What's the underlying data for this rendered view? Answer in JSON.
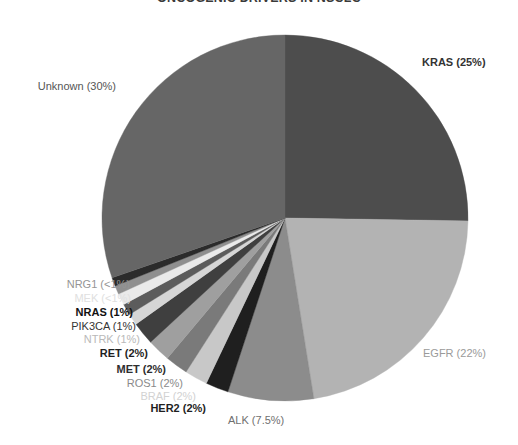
{
  "chart_data": {
    "type": "pie",
    "title": "ONCOGENIC DRIVERS IN NSCLC",
    "xlabel": "",
    "ylabel": "",
    "legend_position": "none",
    "grid": false,
    "categories": [
      "KRAS",
      "EGFR",
      "ALK",
      "HER2",
      "BRAF",
      "ROS1",
      "MET",
      "RET",
      "NTRK",
      "PIK3CA",
      "NRAS",
      "MEK",
      "NRG1",
      "Unknown"
    ],
    "values": [
      25,
      22,
      7.5,
      2,
      2,
      2,
      2,
      2,
      1,
      1,
      1,
      0.75,
      0.75,
      30
    ],
    "value_labels": [
      "25%",
      "22%",
      "7.5%",
      "2%",
      "2%",
      "2%",
      "2%",
      "2%",
      "1%",
      "1%",
      "1%",
      "<1%",
      "<1%",
      "30%"
    ],
    "slice_colors": [
      "#4d4d4d",
      "#b3b3b3",
      "#8c8c8c",
      "#1f1f1f",
      "#c8c8c8",
      "#7a7a7a",
      "#9f9f9f",
      "#3f3f3f",
      "#d6d6d6",
      "#5c5c5c",
      "#eaeaea",
      "#8f8f8f",
      "#2b2b2b",
      "#666666"
    ],
    "start_angle_deg": -90,
    "direction": "clockwise"
  },
  "labels": [
    {
      "id": "kras",
      "text": "KRAS (25%)",
      "color": "#333333",
      "bold": true,
      "x": 422,
      "y": 57,
      "align": "left"
    },
    {
      "id": "egfr",
      "text": "EGFR (22%)",
      "color": "#9a9a9a",
      "bold": false,
      "x": 423,
      "y": 348,
      "align": "left"
    },
    {
      "id": "alk",
      "text": "ALK (7.5%)",
      "color": "#6f6f6f",
      "bold": false,
      "x": 228,
      "y": 415,
      "align": "left"
    },
    {
      "id": "her2",
      "text": "HER2 (2%)",
      "color": "#1f1f1f",
      "bold": true,
      "x": 206,
      "y": 403,
      "align": "right"
    },
    {
      "id": "braf",
      "text": "BRAF (2%)",
      "color": "#d2d2d2",
      "bold": false,
      "x": 196,
      "y": 391,
      "align": "right"
    },
    {
      "id": "ros1",
      "text": "ROS1 (2%)",
      "color": "#8a8a8a",
      "bold": false,
      "x": 183,
      "y": 378,
      "align": "right"
    },
    {
      "id": "met",
      "text": "MET (2%)",
      "color": "#2e2e2e",
      "bold": true,
      "x": 166,
      "y": 364,
      "align": "right"
    },
    {
      "id": "ret",
      "text": "RET (2%)",
      "color": "#1f1f1f",
      "bold": true,
      "x": 148,
      "y": 348,
      "align": "right"
    },
    {
      "id": "ntrk",
      "text": "NTRK (1%)",
      "color": "#b9b9b9",
      "bold": false,
      "x": 140,
      "y": 334,
      "align": "right"
    },
    {
      "id": "pik3ca",
      "text": "PIK3CA (1%)",
      "color": "#353535",
      "bold": false,
      "x": 136,
      "y": 321,
      "align": "right"
    },
    {
      "id": "nras",
      "text": "NRAS  (1%)",
      "color": "#111111",
      "bold": true,
      "x": 133,
      "y": 307,
      "align": "right"
    },
    {
      "id": "mek",
      "text": "MEK (<1%)",
      "color": "#e0e0e0",
      "bold": false,
      "x": 131,
      "y": 293,
      "align": "right"
    },
    {
      "id": "nrg1",
      "text": "NRG1  (<1%)",
      "color": "#959595",
      "bold": false,
      "x": 130,
      "y": 279,
      "align": "right"
    },
    {
      "id": "unknown",
      "text": "Unknown (30%)",
      "color": "#555555",
      "bold": false,
      "x": 116,
      "y": 81,
      "align": "right"
    }
  ],
  "geometry": {
    "cx": 285,
    "cy": 218,
    "r": 183
  }
}
